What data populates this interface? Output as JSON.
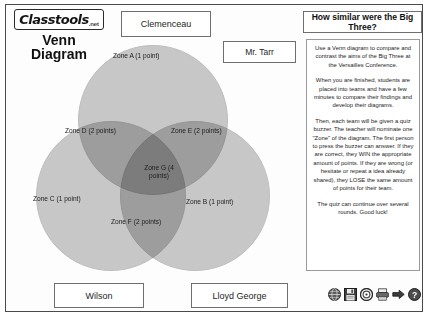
{
  "brand": {
    "logo_word": "Classtools",
    "logo_tld": ".net",
    "app_title_line1": "Venn",
    "app_title_line2": "Diagram"
  },
  "labels": {
    "top_circle": "Clemenceau",
    "teacher": "Mr. Tarr",
    "left_circle": "Wilson",
    "right_circle": "Lloyd George"
  },
  "question": {
    "banner": "How similar were the Big Three?"
  },
  "instructions": {
    "paragraph1": "Use a Venn diagram to compare and contrast the aims of the Big Three at the Versailles Conference.",
    "paragraph2": "When you are finished, students are placed into teams and have a few minutes to compare their findings and develop their diagrams.",
    "paragraph3": "Then, each team will be given a quiz buzzer. The teacher will nominate one \"Zone\" of the diagram. The first person to press the buzzer can answer. If they are correct, they WIN the appropriate amount of points. If they are wrong (or hesitate or repeat a idea already shared), they LOSE the same amount of points for their team.",
    "paragraph4": "The quiz can continue over several rounds. Good luck!"
  },
  "venn": {
    "zones": [
      {
        "id": "a",
        "label": "Zone A (1 point)"
      },
      {
        "id": "d",
        "label": "Zone D (2 points)"
      },
      {
        "id": "e",
        "label": "Zone E (2 points)"
      },
      {
        "id": "g",
        "label": "Zone G (4 points)"
      },
      {
        "id": "c",
        "label": "Zone C (1 point)"
      },
      {
        "id": "b",
        "label": "Zone B (1 point)"
      },
      {
        "id": "f",
        "label": "Zone F (2 points)"
      }
    ],
    "circle_fill": "#9c9c9c",
    "circle_stroke": "#8a8a8a"
  },
  "toolbar": {
    "items": [
      {
        "name": "globe-icon",
        "title": "Share online"
      },
      {
        "name": "save-icon",
        "title": "Save"
      },
      {
        "name": "target-icon",
        "title": "Options"
      },
      {
        "name": "print-icon",
        "title": "Print"
      },
      {
        "name": "export-icon",
        "title": "Export"
      },
      {
        "name": "help-icon",
        "title": "Help"
      }
    ]
  },
  "caption": {
    "text": ""
  }
}
